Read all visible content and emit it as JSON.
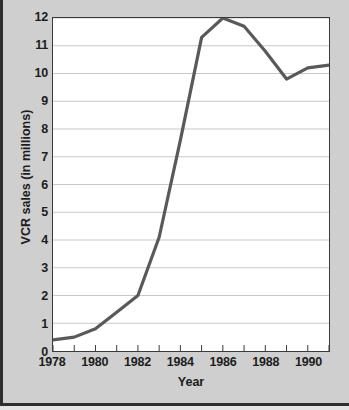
{
  "chart_data": {
    "type": "line",
    "title": "",
    "xlabel": "Year",
    "ylabel": "VCR sales (in millions)",
    "x": [
      1978,
      1979,
      1980,
      1981,
      1982,
      1983,
      1984,
      1985,
      1986,
      1987,
      1988,
      1989,
      1990,
      1991
    ],
    "values": [
      0.4,
      0.5,
      0.8,
      1.4,
      2.0,
      4.1,
      7.6,
      11.3,
      12.0,
      11.7,
      10.8,
      9.8,
      10.2,
      10.3
    ],
    "series": [
      {
        "name": "VCR sales",
        "values": [
          0.4,
          0.5,
          0.8,
          1.4,
          2.0,
          4.1,
          7.6,
          11.3,
          12.0,
          11.7,
          10.8,
          9.8,
          10.2,
          10.3
        ]
      }
    ],
    "xlim": [
      1978,
      1991
    ],
    "ylim": [
      0,
      12
    ],
    "x_tick_values": [
      1978,
      1979,
      1980,
      1981,
      1982,
      1983,
      1984,
      1985,
      1986,
      1987,
      1988,
      1989,
      1990,
      1991
    ],
    "x_tick_labels": [
      "1978",
      "",
      "1980",
      "",
      "1982",
      "",
      "1984",
      "",
      "1986",
      "",
      "1988",
      "",
      "1990",
      ""
    ],
    "y_tick_values": [
      0,
      1,
      2,
      3,
      4,
      5,
      6,
      7,
      8,
      9,
      10,
      11,
      12
    ],
    "y_tick_labels": [
      "0",
      "1",
      "2",
      "3",
      "4",
      "5",
      "6",
      "7",
      "8",
      "9",
      "10",
      "11",
      "12"
    ],
    "grid": "horizontal",
    "legend": "none",
    "line_color": "#595959",
    "grid_color": "#c8c8c8",
    "frame_color": "#3a3a3a",
    "plot_background": "#ffffff",
    "page_background": "#cfcfcf"
  }
}
